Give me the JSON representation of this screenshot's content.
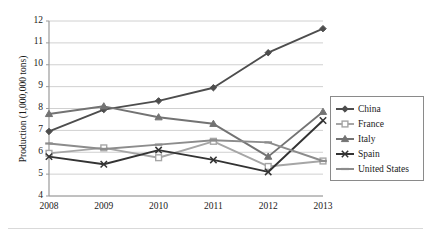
{
  "chart_data": {
    "type": "line",
    "title": "",
    "xlabel": "",
    "ylabel": "Production (1,000,000 tons)",
    "categories": [
      "2008",
      "2009",
      "2010",
      "2011",
      "2012",
      "2013"
    ],
    "x": [
      2008,
      2009,
      2010,
      2011,
      2012,
      2013
    ],
    "ylim": [
      4,
      12
    ],
    "yticks": [
      4,
      5,
      6,
      7,
      8,
      9,
      10,
      11,
      12
    ],
    "ytick_labels": [
      "4",
      "5",
      "6",
      "7",
      "8",
      "9",
      "10",
      "11",
      "12"
    ],
    "grid": "horizontal",
    "legend_position": "right",
    "series": [
      {
        "name": "China",
        "values": [
          6.95,
          7.95,
          8.35,
          8.95,
          10.55,
          11.65
        ],
        "color": "#4d4d4d",
        "marker": "diamond"
      },
      {
        "name": "France",
        "values": [
          5.95,
          6.2,
          5.75,
          6.5,
          5.35,
          5.6
        ],
        "color": "#a6a6a6",
        "marker": "square"
      },
      {
        "name": "Italy",
        "values": [
          7.75,
          8.1,
          7.6,
          7.3,
          5.8,
          7.85
        ],
        "color": "#737373",
        "marker": "triangle"
      },
      {
        "name": "Spain",
        "values": [
          5.8,
          5.45,
          6.1,
          5.65,
          5.1,
          7.45
        ],
        "color": "#333333",
        "marker": "cross"
      },
      {
        "name": "United States",
        "values": [
          6.4,
          6.15,
          6.35,
          6.55,
          6.45,
          5.6
        ],
        "color": "#8c8c8c",
        "marker": "dash"
      }
    ]
  },
  "legend": {
    "items": [
      {
        "label": "China"
      },
      {
        "label": "France"
      },
      {
        "label": "Italy"
      },
      {
        "label": "Spain"
      },
      {
        "label": "United States"
      }
    ]
  },
  "axes": {
    "y_title": "Production (1,000,000 tons)",
    "y_ticks": [
      "12",
      "11",
      "10",
      "9",
      "8",
      "7",
      "6",
      "5",
      "4"
    ],
    "x_ticks": [
      "2008",
      "2009",
      "2010",
      "2011",
      "2012",
      "2013"
    ]
  }
}
